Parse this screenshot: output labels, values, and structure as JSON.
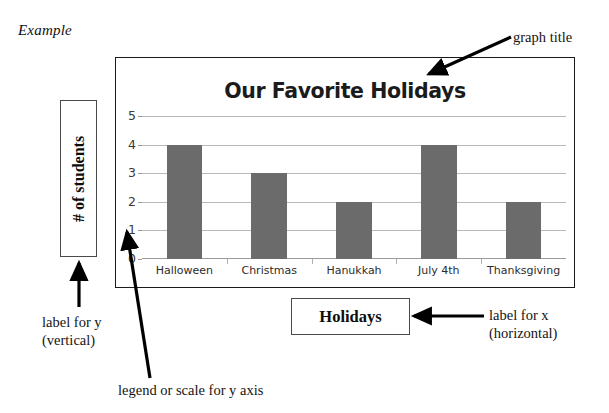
{
  "page": {
    "caption": "Example"
  },
  "chart_data": {
    "type": "bar",
    "title": "Our Favorite Holidays",
    "xlabel": "Holidays",
    "ylabel": "# of students",
    "categories": [
      "Halloween",
      "Christmas",
      "Hanukkah",
      "July 4th",
      "Thanksgiving"
    ],
    "values": [
      4,
      3,
      2,
      4,
      2
    ],
    "yticks": [
      0,
      1,
      2,
      3,
      4,
      5
    ],
    "ylim": [
      0,
      5
    ],
    "grid": true,
    "legend": "none",
    "bar_color": "#6b6b6b",
    "gridline_color": "#b9b9b9",
    "title_color": "#1b1b1b",
    "annotations": [
      "graph title",
      "label for x\n(horizontal)",
      "label for y\n(vertical)",
      "legend or scale for y axis"
    ]
  },
  "annotations": {
    "graph_title": "graph title",
    "label_for_x": "label for x\n(horizontal)",
    "label_for_y": "label for y\n(vertical)",
    "legend_y_axis": "legend or scale for y axis"
  }
}
